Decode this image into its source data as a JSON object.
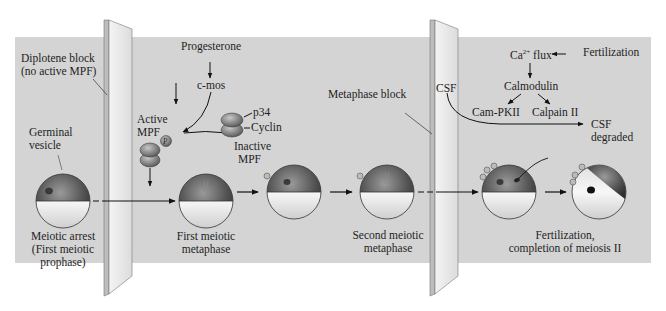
{
  "diagram": {
    "colors": {
      "background": "#ffffff",
      "panel": "#d4d4d4",
      "barrier": "#e6e6e6",
      "egg_animal_pole": "#5a5a5a",
      "egg_vegetal_pole": "#f0f0f0",
      "text": "#1e1e1e"
    },
    "barriers": [
      {
        "id": "diplotene-barrier",
        "label": "Diplotene block",
        "sublabel": "(no active MPF)"
      },
      {
        "id": "metaphase-barrier",
        "label": "Metaphase block"
      }
    ],
    "labels": {
      "diplotene_l1": "Diplotene block",
      "diplotene_l2": "(no active MPF)",
      "germinal_l1": "Germinal",
      "germinal_l2": "vesicle",
      "progesterone": "Progesterone",
      "cmos": "c-mos",
      "active_mpf_l1": "Active",
      "active_mpf_l2": "MPF",
      "phospho": "P",
      "p34": "p34",
      "cyclin": "Cyclin",
      "inactive_mpf_l1": "Inactive",
      "inactive_mpf_l2": "MPF",
      "metaphase_block": "Metaphase block",
      "csf": "CSF",
      "ca_flux_base": "Ca",
      "ca_flux_sup": "2+",
      "ca_flux_tail": " flux",
      "fertilization": "Fertilization",
      "calmodulin": "Calmodulin",
      "campkii": "Cam-PKII",
      "calpain": "Calpain II",
      "csf_degraded_l1": "CSF",
      "csf_degraded_l2": "degraded"
    },
    "stages": [
      {
        "l1": "Meiotic arrest",
        "l2": "(First meiotic",
        "l3": "prophase)"
      },
      {
        "l1": "First meiotic",
        "l2": "metaphase"
      },
      {
        "l1": "",
        "l2": ""
      },
      {
        "l1": "Second meiotic",
        "l2": "metaphase"
      },
      {
        "l1": "",
        "l2": ""
      },
      {
        "l1": "Fertilization,",
        "l2": "completion of meiosis II"
      }
    ]
  }
}
